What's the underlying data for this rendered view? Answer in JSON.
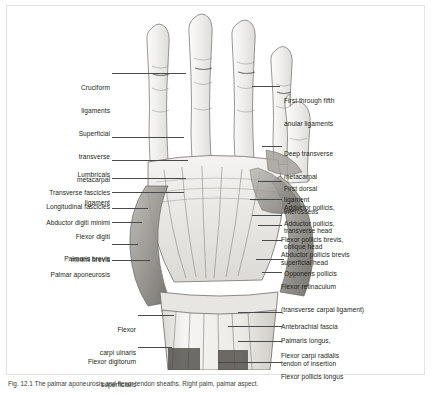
{
  "figure": {
    "kind": "anatomical-illustration",
    "caption_number": "Fig. 12.1",
    "caption_text": "Fig. 12.1  The palmar aponeurosis and flexor tendon sheaths.  Right palm, palmar aspect."
  },
  "colors": {
    "frame": "#e3e3e3",
    "leader": "#4a4a4a",
    "label_text": "#231f20",
    "art_ink": "#5a5a5a",
    "art_fill": "#f2f1ef",
    "background": "#ffffff"
  },
  "labels_left": [
    {
      "id": "cruciform-ligaments",
      "lines": [
        "Cruciform",
        "ligaments"
      ]
    },
    {
      "id": "superficial-transverse-metacarpal-ligament",
      "lines": [
        "Superficial",
        "transverse",
        "metacarpal",
        "ligament"
      ]
    },
    {
      "id": "lumbricals",
      "lines": [
        "Lumbricals"
      ]
    },
    {
      "id": "transverse-fascicles",
      "lines": [
        "Transverse fascicles"
      ]
    },
    {
      "id": "longitudinal-fascicles",
      "lines": [
        "Longitudinal fascicles"
      ]
    },
    {
      "id": "abductor-digiti-minimi",
      "lines": [
        "Abductor digiti minimi"
      ]
    },
    {
      "id": "flexor-digiti-minimi-brevis",
      "lines": [
        "Flexor digiti",
        "minimi brevis"
      ]
    },
    {
      "id": "palmaris-brevis",
      "lines": [
        "Palmaris brevis"
      ]
    },
    {
      "id": "palmar-aponeurosis",
      "lines": [
        "Palmar aponeurosis"
      ]
    },
    {
      "id": "flexor-carpi-ulnaris",
      "lines": [
        "Flexor",
        "carpi ulnaris"
      ]
    },
    {
      "id": "flexor-digitorum-superficialis",
      "lines": [
        "Flexor digitorum",
        "superficialis"
      ]
    }
  ],
  "labels_right": [
    {
      "id": "first-through-fifth-anular-ligaments",
      "lines": [
        "First through fifth",
        "anular ligaments"
      ]
    },
    {
      "id": "deep-transverse-metacarpal-ligament",
      "lines": [
        "Deep transverse",
        "metacarpal",
        "ligament"
      ]
    },
    {
      "id": "first-dorsal-interosseus",
      "lines": [
        "First dorsal",
        "interosseus"
      ]
    },
    {
      "id": "adductor-pollicis-transverse-head",
      "lines": [
        "Adductor pollicis,",
        "transverse head"
      ]
    },
    {
      "id": "adductor-pollicis-oblique-head",
      "lines": [
        "Adductor pollicis,",
        "oblique head"
      ]
    },
    {
      "id": "flexor-pollicis-brevis-superficial-head",
      "lines": [
        "Flexor pollicis brevis,",
        "superficial head"
      ]
    },
    {
      "id": "abductor-pollicis-brevis",
      "lines": [
        "Abductor pollicis brevis"
      ]
    },
    {
      "id": "opponens-pollicis",
      "lines": [
        "Opponens pollicis"
      ]
    },
    {
      "id": "flexor-retinaculum",
      "lines": [
        "Flexor retinaculum",
        "(transverse carpal ligament)"
      ]
    },
    {
      "id": "antebrachial-fascia",
      "lines": [
        "Antebrachial fascia"
      ]
    },
    {
      "id": "palmaris-longus-tendon-of-insertion",
      "lines": [
        "Palmaris longus,",
        "tendon of insertion"
      ]
    },
    {
      "id": "flexor-carpi-radialis",
      "lines": [
        "Flexor carpi radialis"
      ]
    },
    {
      "id": "flexor-pollicis-longus",
      "lines": [
        "Flexor pollicis longus"
      ]
    }
  ]
}
